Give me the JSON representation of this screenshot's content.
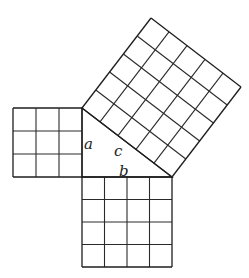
{
  "figure": {
    "type": "pythagorean-theorem-grid-squares",
    "unit_px": 22.7,
    "triangle": {
      "right_angle_vertex": [
        82,
        177
      ],
      "top_vertex": [
        82,
        108
      ],
      "right_vertex": [
        172,
        177
      ],
      "legs": {
        "a": 3,
        "b": 4
      },
      "hypotenuse": {
        "c": 5
      }
    },
    "squares": [
      {
        "name": "square-a",
        "side_units": 3,
        "cells": 9
      },
      {
        "name": "square-b",
        "side_units": 4,
        "cells": 16
      },
      {
        "name": "square-c",
        "side_units": 5,
        "cells": 25
      }
    ],
    "labels": {
      "a": "a",
      "b": "b",
      "c": "c"
    },
    "colors": {
      "line": "#2a2a2a",
      "label": "#222222",
      "background": "#ffffff"
    }
  }
}
